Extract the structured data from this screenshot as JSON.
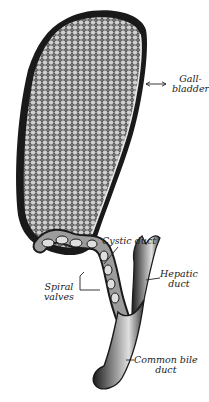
{
  "figure": {
    "colors": {
      "ink": "#1a1a1a",
      "background": "#ffffff",
      "mid": "#6b6b6b",
      "light": "#d8d8d8"
    }
  },
  "labels": {
    "gallbladder": {
      "line1": "Gall-",
      "line2": "bladder"
    },
    "cystic_duct": {
      "line1": "Cystic duct"
    },
    "hepatic_duct": {
      "line1": "Hepatic",
      "line2": "duct"
    },
    "spiral_valves": {
      "line1": "Spiral",
      "line2": "valves"
    },
    "common_bile_duct": {
      "line1": "Common bile",
      "line2": "duct"
    }
  }
}
